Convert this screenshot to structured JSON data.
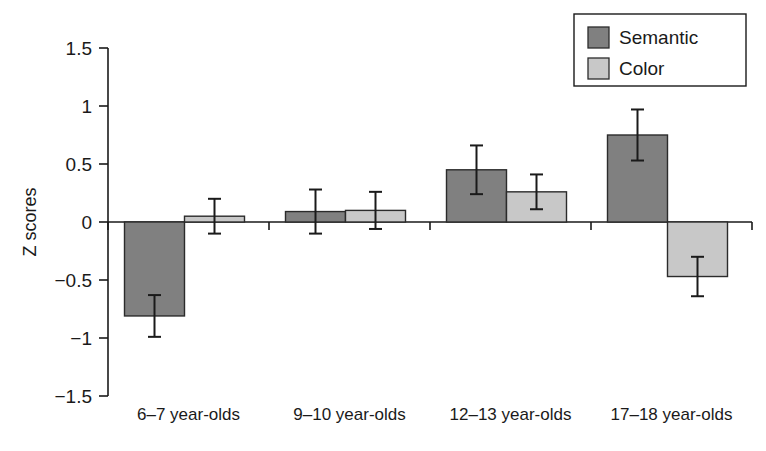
{
  "chart_data": {
    "type": "bar",
    "title": "",
    "subtitle": "",
    "xlabel": "",
    "ylabel": "Z scores",
    "ylim": [
      -1.5,
      1.5
    ],
    "yticks": [
      1.5,
      1,
      0.5,
      0,
      -0.5,
      -1,
      -1.5
    ],
    "ytick_labels": [
      "1.5",
      "1",
      "0.5",
      "0",
      "−0.5",
      "−1",
      "−1.5"
    ],
    "grid": false,
    "legend_position": "top-right",
    "categories": [
      "6–7 year-olds",
      "9–10 year-olds",
      "12–13 year-olds",
      "17–18 year-olds"
    ],
    "series": [
      {
        "name": "Semantic",
        "color": "#808080",
        "values": [
          -0.81,
          0.09,
          0.45,
          0.75
        ],
        "errors": [
          0.18,
          0.19,
          0.21,
          0.22
        ]
      },
      {
        "name": "Color",
        "color": "#c8c8c8",
        "values": [
          0.05,
          0.1,
          0.26,
          -0.47
        ],
        "errors": [
          0.15,
          0.16,
          0.15,
          0.17
        ]
      }
    ]
  },
  "legend": {
    "entries": [
      {
        "label": "Semantic",
        "color": "#808080"
      },
      {
        "label": "Color",
        "color": "#c8c8c8"
      }
    ]
  },
  "axis": {
    "y_title": "Z scores",
    "zero_label": "0"
  }
}
